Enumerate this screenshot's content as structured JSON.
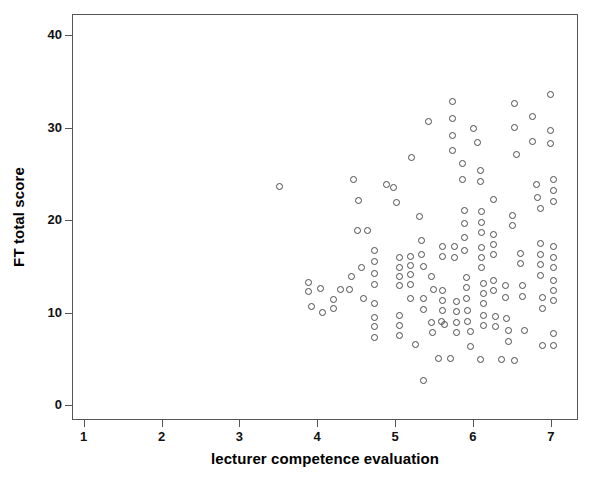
{
  "chart_data": {
    "type": "scatter",
    "title": "",
    "xlabel": "lecturer competence evaluation",
    "ylabel": "FT total score",
    "xlim": [
      0.85,
      7.35
    ],
    "ylim": [
      -1.6,
      42.3
    ],
    "xticks": [
      1,
      2,
      3,
      4,
      5,
      6,
      7
    ],
    "xtick_labels": [
      "1",
      "2",
      "3",
      "4",
      "5",
      "6",
      "7"
    ],
    "yticks": [
      0,
      10,
      20,
      30,
      40
    ],
    "ytick_labels": [
      "0",
      "10",
      "20",
      "30",
      "40"
    ],
    "grid": false,
    "legend": false,
    "marker": "open-circle",
    "marker_color": "#4a4a4a",
    "frame_color": "#555555",
    "series": [
      {
        "name": "observations",
        "points": [
          [
            3.5,
            23.8
          ],
          [
            3.88,
            13.4
          ],
          [
            3.88,
            12.4
          ],
          [
            4.03,
            12.7
          ],
          [
            3.92,
            10.8
          ],
          [
            4.06,
            10.1
          ],
          [
            4.2,
            11.5
          ],
          [
            4.2,
            10.6
          ],
          [
            4.45,
            24.5
          ],
          [
            4.52,
            22.2
          ],
          [
            4.5,
            19.0
          ],
          [
            4.63,
            19.0
          ],
          [
            4.55,
            15.0
          ],
          [
            4.72,
            16.8
          ],
          [
            4.72,
            15.6
          ],
          [
            4.72,
            14.4
          ],
          [
            4.72,
            13.2
          ],
          [
            4.43,
            14.0
          ],
          [
            4.28,
            12.6
          ],
          [
            4.4,
            12.6
          ],
          [
            4.58,
            11.6
          ],
          [
            4.72,
            11.1
          ],
          [
            4.72,
            9.6
          ],
          [
            4.72,
            8.6
          ],
          [
            4.72,
            7.4
          ],
          [
            4.88,
            24.0
          ],
          [
            4.97,
            23.7
          ],
          [
            5.0,
            22.0
          ],
          [
            5.05,
            16.1
          ],
          [
            5.05,
            15.0
          ],
          [
            5.05,
            14.0
          ],
          [
            5.05,
            13.0
          ],
          [
            5.05,
            9.8
          ],
          [
            5.05,
            8.7
          ],
          [
            5.05,
            7.6
          ],
          [
            5.18,
            16.2
          ],
          [
            5.18,
            15.2
          ],
          [
            5.18,
            14.2
          ],
          [
            5.18,
            13.2
          ],
          [
            5.18,
            11.6
          ],
          [
            5.2,
            26.9
          ],
          [
            5.3,
            20.5
          ],
          [
            5.33,
            17.9
          ],
          [
            5.33,
            16.4
          ],
          [
            5.35,
            15.1
          ],
          [
            5.35,
            11.6
          ],
          [
            5.35,
            10.5
          ],
          [
            5.45,
            9.0
          ],
          [
            5.58,
            9.2
          ],
          [
            5.47,
            8.0
          ],
          [
            5.35,
            2.8
          ],
          [
            5.55,
            5.2
          ],
          [
            5.7,
            5.2
          ],
          [
            5.42,
            30.8
          ],
          [
            5.72,
            32.9
          ],
          [
            5.72,
            31.1
          ],
          [
            5.72,
            29.3
          ],
          [
            5.72,
            27.6
          ],
          [
            5.85,
            26.2
          ],
          [
            5.85,
            24.5
          ],
          [
            5.88,
            21.2
          ],
          [
            5.88,
            19.8
          ],
          [
            5.88,
            18.2
          ],
          [
            5.88,
            16.8
          ],
          [
            5.75,
            17.3
          ],
          [
            5.75,
            16.1
          ],
          [
            5.9,
            13.9
          ],
          [
            5.9,
            12.8
          ],
          [
            5.9,
            11.6
          ],
          [
            5.92,
            10.3
          ],
          [
            5.92,
            9.2
          ],
          [
            5.95,
            8.1
          ],
          [
            5.78,
            11.3
          ],
          [
            5.78,
            10.2
          ],
          [
            5.78,
            9.1
          ],
          [
            5.78,
            8.0
          ],
          [
            6.0,
            30.0
          ],
          [
            6.05,
            28.5
          ],
          [
            6.08,
            25.5
          ],
          [
            6.08,
            24.3
          ],
          [
            6.1,
            21.0
          ],
          [
            6.1,
            19.9
          ],
          [
            6.1,
            18.8
          ],
          [
            6.1,
            17.2
          ],
          [
            6.1,
            16.1
          ],
          [
            6.1,
            15.0
          ],
          [
            6.12,
            13.3
          ],
          [
            6.12,
            12.2
          ],
          [
            6.12,
            11.1
          ],
          [
            6.12,
            9.8
          ],
          [
            6.12,
            8.7
          ],
          [
            6.25,
            22.3
          ],
          [
            6.25,
            18.6
          ],
          [
            6.25,
            17.5
          ],
          [
            6.25,
            16.4
          ],
          [
            6.25,
            13.6
          ],
          [
            6.25,
            12.5
          ],
          [
            6.28,
            9.7
          ],
          [
            6.28,
            8.6
          ],
          [
            6.4,
            13.0
          ],
          [
            6.4,
            11.8
          ],
          [
            6.42,
            9.5
          ],
          [
            6.45,
            8.2
          ],
          [
            6.45,
            7.0
          ],
          [
            6.52,
            32.7
          ],
          [
            6.52,
            30.1
          ],
          [
            6.55,
            27.2
          ],
          [
            6.5,
            20.6
          ],
          [
            6.5,
            19.5
          ],
          [
            6.6,
            16.5
          ],
          [
            6.6,
            15.4
          ],
          [
            6.62,
            13.0
          ],
          [
            6.62,
            11.9
          ],
          [
            6.65,
            8.2
          ],
          [
            6.52,
            4.9
          ],
          [
            6.75,
            31.3
          ],
          [
            6.75,
            28.6
          ],
          [
            6.8,
            24.0
          ],
          [
            6.82,
            22.6
          ],
          [
            6.85,
            21.4
          ],
          [
            6.85,
            17.6
          ],
          [
            6.85,
            16.4
          ],
          [
            6.85,
            15.3
          ],
          [
            6.85,
            14.1
          ],
          [
            6.88,
            11.7
          ],
          [
            6.88,
            10.6
          ],
          [
            6.98,
            33.7
          ],
          [
            6.98,
            29.8
          ],
          [
            6.98,
            28.4
          ],
          [
            7.02,
            24.5
          ],
          [
            7.02,
            23.3
          ],
          [
            7.02,
            22.1
          ],
          [
            7.02,
            17.3
          ],
          [
            7.02,
            16.1
          ],
          [
            7.02,
            15.0
          ],
          [
            7.02,
            13.6
          ],
          [
            7.02,
            12.5
          ],
          [
            7.02,
            11.4
          ],
          [
            7.02,
            7.9
          ],
          [
            7.02,
            6.6
          ],
          [
            6.88,
            6.6
          ],
          [
            5.95,
            6.5
          ],
          [
            5.6,
            17.3
          ],
          [
            5.6,
            16.2
          ],
          [
            5.45,
            14.0
          ],
          [
            5.48,
            12.6
          ],
          [
            5.6,
            12.5
          ],
          [
            5.6,
            11.4
          ],
          [
            5.6,
            10.3
          ],
          [
            5.62,
            8.8
          ],
          [
            5.25,
            6.7
          ],
          [
            6.35,
            5.0
          ],
          [
            6.08,
            5.0
          ]
        ]
      }
    ]
  },
  "axes": {
    "ylabel": "FT total score",
    "xlabel": "lecturer competence evaluation"
  }
}
